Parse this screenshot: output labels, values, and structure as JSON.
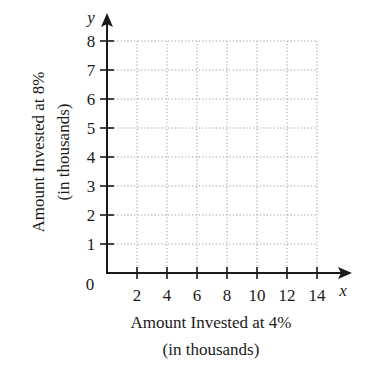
{
  "chart_data": {
    "type": "scatter",
    "title": "",
    "xlabel": "Amount Invested at 4%",
    "xlabel_sub": "(in thousands)",
    "ylabel": "Amount Invested at 8%",
    "ylabel_sub": "(in thousands)",
    "x_axis_var": "x",
    "y_axis_var": "y",
    "origin_label": "0",
    "xlim": [
      0,
      14
    ],
    "ylim": [
      0,
      8
    ],
    "x_ticks": [
      2,
      4,
      6,
      8,
      10,
      12,
      14
    ],
    "x_tick_labels": [
      "2",
      "4",
      "6",
      "8",
      "10",
      "12",
      "14"
    ],
    "y_ticks": [
      1,
      2,
      3,
      4,
      5,
      6,
      7,
      8
    ],
    "y_tick_labels": [
      "1",
      "2",
      "3",
      "4",
      "5",
      "6",
      "7",
      "8"
    ],
    "grid": true,
    "grid_style": "dotted",
    "series": [],
    "legend": null
  },
  "colors": {
    "axis": "#1a1a1a",
    "grid": "#9a9a9a",
    "text": "#1a1a1a",
    "background": "#ffffff"
  }
}
